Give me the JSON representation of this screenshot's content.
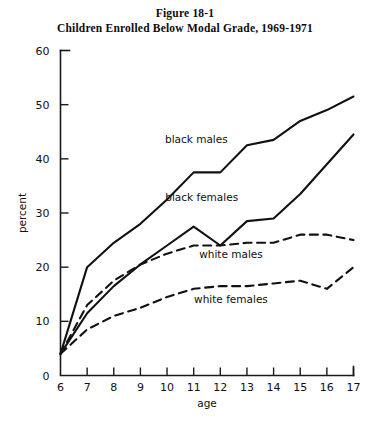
{
  "figure": {
    "number_line": "Figure 18-1",
    "caption_line": "Children Enrolled Below Modal Grade, 1969-1971"
  },
  "chart_data": {
    "type": "line",
    "title": "Children Enrolled Below Modal Grade, 1969-1971",
    "xlabel": "age",
    "ylabel": "percent",
    "xlim": [
      6,
      17
    ],
    "ylim": [
      0,
      60
    ],
    "grid": false,
    "legend": "inline-labels",
    "x": [
      6,
      7,
      8,
      9,
      10,
      11,
      12,
      13,
      14,
      15,
      16,
      17
    ],
    "xticklabels": [
      "6",
      "7",
      "8",
      "9",
      "10",
      "11",
      "12",
      "13",
      "14",
      "15",
      "16",
      "17"
    ],
    "yticks": [
      0,
      10,
      20,
      30,
      40,
      50,
      60
    ],
    "yticklabels": [
      "0",
      "10",
      "20",
      "30",
      "40",
      "50",
      "60"
    ],
    "series": [
      {
        "name": "black males",
        "style": "solid",
        "label_x": 11.1,
        "label_y": 43.0,
        "values": [
          4.0,
          20.0,
          24.5,
          28.0,
          32.5,
          37.5,
          37.5,
          42.5,
          43.5,
          47.0,
          49.0,
          51.5
        ]
      },
      {
        "name": "black females",
        "style": "solid",
        "label_x": 11.3,
        "label_y": 32.2,
        "values": [
          4.0,
          11.5,
          16.5,
          20.5,
          24.0,
          27.5,
          24.0,
          28.5,
          29.0,
          33.5,
          39.0,
          44.5
        ]
      },
      {
        "name": "white males",
        "style": "dashed",
        "label_x": 12.4,
        "label_y": 21.7,
        "values": [
          4.0,
          13.0,
          17.5,
          20.5,
          22.5,
          24.0,
          24.0,
          24.5,
          24.5,
          26.0,
          26.0,
          25.0
        ]
      },
      {
        "name": "white females",
        "style": "dashed",
        "label_x": 12.4,
        "label_y": 13.3,
        "values": [
          4.0,
          8.5,
          11.0,
          12.5,
          14.5,
          16.0,
          16.5,
          16.5,
          17.0,
          17.5,
          16.0,
          20.0
        ]
      }
    ]
  }
}
